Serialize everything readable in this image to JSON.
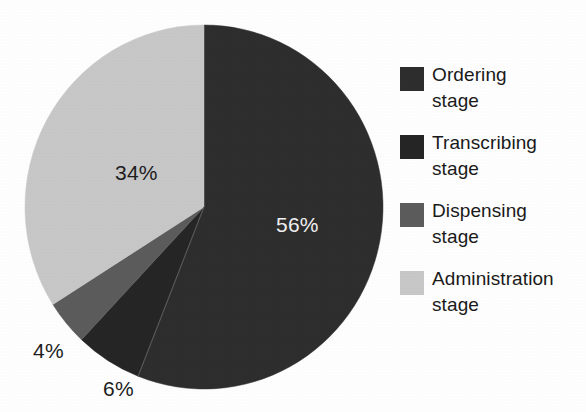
{
  "chart_data": {
    "type": "pie",
    "title": "",
    "subtitle": "",
    "xlabel": "",
    "ylabel": "",
    "legend_position": "right",
    "grid": false,
    "categories": [
      "Ordering stage",
      "Transcribing stage",
      "Dispensing stage",
      "Administration stage"
    ],
    "values": [
      56,
      6,
      4,
      34
    ],
    "value_labels": [
      "56%",
      "6%",
      "4%",
      "34%"
    ],
    "units": "percent",
    "start_angle_deg": 0,
    "direction": "clockwise",
    "slices": [
      {
        "name": "Ordering stage",
        "legend_line1": "Ordering",
        "legend_line2": "stage",
        "value": 56,
        "label": "56%",
        "color": "#2e2e2e",
        "label_color": "#f2f2f2",
        "label_placement": "inside"
      },
      {
        "name": "Transcribing stage",
        "legend_line1": "Transcribing",
        "legend_line2": "stage",
        "value": 6,
        "label": "6%",
        "color": "#262626",
        "label_color": "#1d1d1d",
        "label_placement": "outside"
      },
      {
        "name": "Dispensing stage",
        "legend_line1": "Dispensing",
        "legend_line2": "stage",
        "value": 4,
        "label": "4%",
        "color": "#5c5c5c",
        "label_color": "#1d1d1d",
        "label_placement": "outside"
      },
      {
        "name": "Administration stage",
        "legend_line1": "Administration",
        "legend_line2": "stage",
        "value": 34,
        "label": "34%",
        "color": "#c8c8c8",
        "label_color": "#1d1d1d",
        "label_placement": "inside"
      }
    ]
  },
  "colors": {
    "background": "#ffffff",
    "ordering": "#2e2e2e",
    "transcribing": "#262626",
    "dispensing": "#5c5c5c",
    "administration": "#c8c8c8",
    "text": "#1a1a1a",
    "label_on_dark": "#f2f2f2"
  },
  "legend": {
    "items": [
      {
        "line1": "Ordering",
        "line2": "stage",
        "swatch": "#2e2e2e"
      },
      {
        "line1": "Transcribing",
        "line2": "stage",
        "swatch": "#262626"
      },
      {
        "line1": "Dispensing",
        "line2": "stage",
        "swatch": "#5c5c5c"
      },
      {
        "line1": "Administration",
        "line2": "stage",
        "swatch": "#c8c8c8"
      }
    ]
  }
}
